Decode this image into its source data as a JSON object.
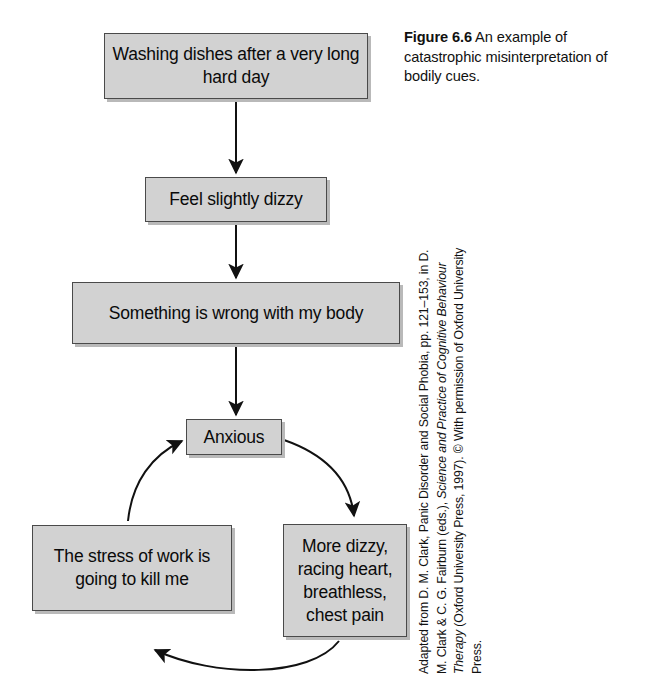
{
  "figure": {
    "label": "Figure 6.6",
    "caption": " An example of catastrophic misinterpretation of bodily cues."
  },
  "credit": {
    "line_start": "Adapted from D. M. Clark, Panic Disorder and Social Phobia, pp. 121–153, in D. M. Clark & C. G. Fairburn (eds.), ",
    "italic_title": "Science and Practice of Cognitive Behaviour Therapy",
    "line_end": " (Oxford University Press, 1997). © With permission of Oxford University Press."
  },
  "diagram": {
    "type": "flowchart-cycle",
    "nodes": [
      {
        "id": "trigger",
        "label": "Washing dishes after a very long hard day"
      },
      {
        "id": "dizzy",
        "label": "Feel slightly dizzy"
      },
      {
        "id": "wrong",
        "label": "Something is wrong with my body"
      },
      {
        "id": "anxious",
        "label": "Anxious"
      },
      {
        "id": "stress",
        "label": "The stress of work is going to kill me"
      },
      {
        "id": "symptoms",
        "label": "More dizzy, racing heart, breathless, chest pain"
      }
    ],
    "edges": [
      {
        "from": "trigger",
        "to": "dizzy",
        "style": "straight-arrow-down"
      },
      {
        "from": "dizzy",
        "to": "wrong",
        "style": "straight-arrow-down"
      },
      {
        "from": "wrong",
        "to": "anxious",
        "style": "straight-arrow-down"
      },
      {
        "from": "anxious",
        "to": "symptoms",
        "style": "curved-arrow-clockwise"
      },
      {
        "from": "symptoms",
        "to": "stress",
        "style": "curved-arrow-clockwise"
      },
      {
        "from": "stress",
        "to": "anxious",
        "style": "curved-arrow-clockwise"
      }
    ]
  },
  "colors": {
    "node_fill": "#d2d2d2",
    "node_border": "#4a4a4a",
    "node_shadow": "#b9b9b9",
    "text": "#0a0a0a",
    "background": "#ffffff"
  }
}
